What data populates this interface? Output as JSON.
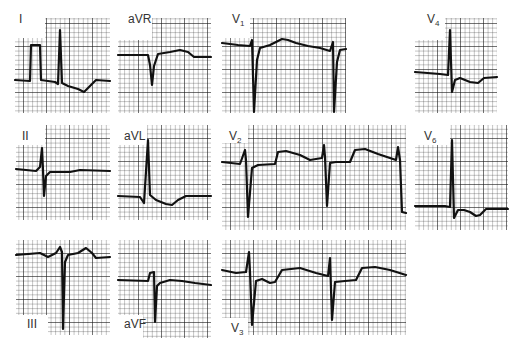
{
  "figure": {
    "colors": {
      "paper": "#ffffff",
      "grid": "#1a1a1a",
      "trace": "#111111",
      "label": "#333333"
    },
    "grid_spacing_px": 4.6
  },
  "leads": [
    {
      "id": "I",
      "label": "I",
      "sub": "",
      "label_pos": [
        19,
        13
      ],
      "panel": {
        "x": 15,
        "y": 18,
        "w": 95,
        "h": 95,
        "notch": "tl",
        "nw": 30,
        "nh": 20
      },
      "trace": "M15,80 L30,81 L31,45 L40,45 L41,80 L55,82 L58,84 L60,30 L62,83 L68,86 L78,89 L84,92 L90,86 L96,80 L110,81"
    },
    {
      "id": "aVR",
      "label": "aVR",
      "sub": "",
      "label_pos": [
        128,
        13
      ],
      "panel": {
        "x": 118,
        "y": 18,
        "w": 93,
        "h": 95,
        "notch": "tl",
        "nw": 34,
        "nh": 22
      },
      "trace": "M118,55 L148,55 L150,65 L152,85 L154,66 L158,54 L170,52 L180,50 L188,52 L194,57 L211,57"
    },
    {
      "id": "V1",
      "label": "V",
      "sub": "1",
      "label_pos": [
        232,
        13
      ],
      "panel": {
        "x": 222,
        "y": 18,
        "w": 124,
        "h": 95,
        "notch": "tl",
        "nw": 28,
        "nh": 20
      },
      "trace": "M222,43 L238,45 L250,46 L252,40 L254,112 L257,60 L260,48 L270,45 L282,39 L288,40 L296,43 L308,46 L320,48 L330,51 L333,42 L334,112 L337,62 L340,50 L346,49"
    },
    {
      "id": "V4",
      "label": "V",
      "sub": "4",
      "label_pos": [
        427,
        13
      ],
      "panel": {
        "x": 415,
        "y": 18,
        "w": 82,
        "h": 95,
        "notch": "tl",
        "nw": 30,
        "nh": 22
      },
      "trace": "M415,72 L440,74 L448,75 L450,30 L452,92 L455,80 L460,78 L470,82 L478,83 L484,78 L497,77"
    },
    {
      "id": "II",
      "label": "II",
      "sub": "",
      "label_pos": [
        22,
        130
      ],
      "panel": {
        "x": 16,
        "y": 125,
        "w": 94,
        "h": 95,
        "notch": "tl",
        "nw": 29,
        "nh": 20
      },
      "trace": "M16,169 L36,171 L40,167 L42,148 L43,170 L44,196 L46,176 L50,172 L70,172 L80,170 L110,171"
    },
    {
      "id": "aVL",
      "label": "aVL",
      "sub": "",
      "label_pos": [
        124,
        130
      ],
      "panel": {
        "x": 118,
        "y": 125,
        "w": 93,
        "h": 95,
        "notch": "tl",
        "nw": 29,
        "nh": 20
      },
      "trace": "M118,196 L140,197 L144,203 L148,140 L150,195 L156,200 L166,204 L172,205 L178,200 L186,196 L211,196"
    },
    {
      "id": "V2",
      "label": "V",
      "sub": "2",
      "label_pos": [
        229,
        130
      ],
      "panel": {
        "x": 222,
        "y": 125,
        "w": 184,
        "h": 105,
        "notch": "tl",
        "nw": 26,
        "nh": 18
      },
      "trace": "M222,162 L240,164 L245,150 L246,160 L248,217 L252,168 L258,165 L275,164 L278,152 L286,151 L300,155 L310,160 L322,158 L324,145 L325,157 L327,206 L330,163 L336,162 L350,162 L355,150 L365,149 L378,154 L390,158 L396,160 L398,147 L400,160 L402,212 L406,213"
    },
    {
      "id": "V6",
      "label": "V",
      "sub": "6",
      "label_pos": [
        424,
        130
      ],
      "panel": {
        "x": 415,
        "y": 125,
        "w": 93,
        "h": 105,
        "notch": "tl",
        "nw": 35,
        "nh": 20
      },
      "trace": "M415,206 L445,206 L450,207 L452,140 L454,218 L458,210 L464,210 L470,212 L476,216 L480,215 L486,209 L508,209"
    },
    {
      "id": "III",
      "label": "III",
      "sub": "",
      "label_pos": [
        27,
        318
      ],
      "panel": {
        "x": 16,
        "y": 240,
        "w": 94,
        "h": 95,
        "notch": "bl",
        "nw": 32,
        "nh": 20
      },
      "trace": "M16,255 L40,253 L48,257 L56,253 L60,247 L62,252 L63,329 L65,262 L68,255 L78,253 L86,248 L92,253 L96,258 L110,257"
    },
    {
      "id": "aVF",
      "label": "aVF",
      "sub": "",
      "label_pos": [
        124,
        318
      ],
      "panel": {
        "x": 118,
        "y": 240,
        "w": 93,
        "h": 98,
        "notch": "bl",
        "nw": 25,
        "nh": 23
      },
      "trace": "M118,280 L148,281 L150,273 L154,272 L155,322 L157,286 L160,283 L170,280 L182,281 L195,283 L211,285"
    },
    {
      "id": "V3",
      "label": "V",
      "sub": "3",
      "label_pos": [
        231,
        322
      ],
      "panel": {
        "x": 222,
        "y": 240,
        "w": 184,
        "h": 95,
        "notch": "bl",
        "nw": 26,
        "nh": 17
      },
      "trace": "M222,270 L236,273 L246,272 L249,252 L250,272 L252,325 L256,281 L262,279 L270,283 L275,282 L282,270 L300,268 L316,273 L328,276 L330,258 L332,320 L335,282 L345,281 L356,280 L362,268 L375,267 L390,270 L406,275"
    }
  ]
}
